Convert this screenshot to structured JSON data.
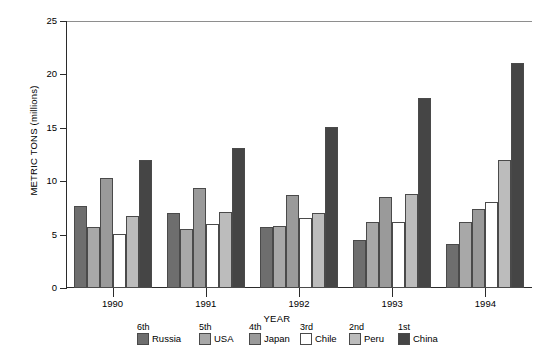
{
  "chart_data": {
    "type": "bar",
    "title": "",
    "xlabel": "YEAR",
    "ylabel": "METRIC TONS (millions)",
    "categories": [
      "1990",
      "1991",
      "1992",
      "1993",
      "1994"
    ],
    "ylim": [
      0,
      25
    ],
    "yticks": [
      0,
      5,
      10,
      15,
      20,
      25
    ],
    "grid": false,
    "legend_position": "bottom",
    "series": [
      {
        "name": "Russia",
        "rank": "6th",
        "color": "#6e6e6e",
        "values": [
          7.7,
          7.0,
          5.7,
          4.5,
          4.1
        ]
      },
      {
        "name": "USA",
        "rank": "5th",
        "color": "#a8a8a8",
        "values": [
          5.7,
          5.5,
          5.8,
          6.2,
          6.2
        ]
      },
      {
        "name": "Japan",
        "rank": "4th",
        "color": "#9a9a9a",
        "values": [
          10.3,
          9.4,
          8.7,
          8.5,
          7.4
        ]
      },
      {
        "name": "Chile",
        "rank": "3rd",
        "color": "#ffffff",
        "values": [
          5.1,
          6.0,
          6.6,
          6.2,
          8.1
        ]
      },
      {
        "name": "Peru",
        "rank": "2nd",
        "color": "#bcbcbc",
        "values": [
          6.7,
          7.1,
          7.0,
          8.8,
          12.0
        ]
      },
      {
        "name": "China",
        "rank": "1st",
        "color": "#454545",
        "values": [
          12.0,
          13.1,
          15.1,
          17.8,
          21.1
        ]
      }
    ]
  },
  "axis": {
    "y_title": "METRIC TONS (millions)",
    "x_title": "YEAR",
    "y_tick_labels": [
      "0",
      "5",
      "10",
      "15",
      "20",
      "25"
    ],
    "x_tick_labels": [
      "1990",
      "1991",
      "1992",
      "1993",
      "1994"
    ]
  },
  "legend": {
    "entries": [
      {
        "rank": "6th",
        "label": "Russia"
      },
      {
        "rank": "5th",
        "label": "USA"
      },
      {
        "rank": "4th",
        "label": "Japan"
      },
      {
        "rank": "3rd",
        "label": "Chile"
      },
      {
        "rank": "2nd",
        "label": "Peru"
      },
      {
        "rank": "1st",
        "label": "China"
      }
    ]
  }
}
